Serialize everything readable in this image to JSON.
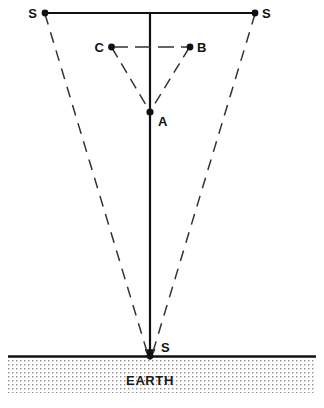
{
  "figure": {
    "ground_label": "EARTH",
    "caption": "",
    "colors": {
      "line": "#111111",
      "dashed": "#333333",
      "ground_fill": "#9a9a9a",
      "background": "#ffffff",
      "text": "#111111"
    },
    "labels": {
      "source_left": "S",
      "source_right": "S",
      "source_ground": "S",
      "point_a": "A",
      "point_b": "B",
      "point_c": "C"
    },
    "points": {
      "source_left": {
        "x": 45,
        "y": 13
      },
      "source_right": {
        "x": 255,
        "y": 13
      },
      "source_ground": {
        "x": 150,
        "y": 356
      },
      "point_a": {
        "x": 150,
        "y": 112
      },
      "point_b": {
        "x": 190,
        "y": 47
      },
      "point_c": {
        "x": 111,
        "y": 47
      }
    },
    "geometry": {
      "top_line_y": 13,
      "top_line_x1": 45,
      "top_line_x2": 255,
      "axis_x": 150,
      "axis_y1": 13,
      "axis_y2": 356,
      "ground_line_y": 356,
      "ground_x1": 8,
      "ground_x2": 316,
      "ground_depth": 36
    }
  }
}
